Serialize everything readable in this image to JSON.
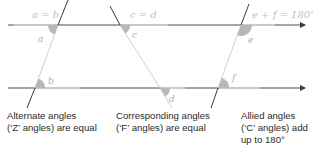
{
  "diagram": {
    "colors": {
      "line_dark": "#4a4a4a",
      "line_light": "#d8d8d8",
      "angle_fill": "#b8b8b8",
      "label": "#b0b0b0",
      "caption_text": "#2b2b2b"
    },
    "panels": [
      {
        "equation": "a = b",
        "angle_labels": [
          "a",
          "b"
        ],
        "caption_line1": "Alternate angles",
        "caption_line2": "(‘Z’ angles) are equal",
        "caption_line3": ""
      },
      {
        "equation": "c = d",
        "angle_labels": [
          "c",
          "d"
        ],
        "caption_line1": "Corresponding angles",
        "caption_line2": "(‘F’ angles) are equal",
        "caption_line3": ""
      },
      {
        "equation": "e + f = 180°",
        "angle_labels": [
          "e",
          "f"
        ],
        "caption_line1": "Allied angles",
        "caption_line2": "(‘C’ angles) add",
        "caption_line3": "up to 180°"
      }
    ],
    "icons": {
      "arrow": "arrowhead-icon"
    }
  }
}
